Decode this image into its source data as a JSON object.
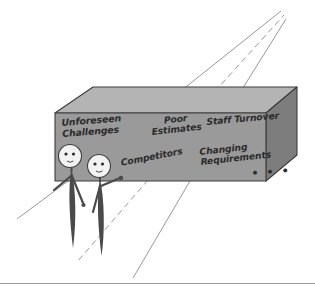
{
  "illustration": {
    "title": "Box of project problems with two stick figures",
    "background_color": "#ffffff",
    "box": {
      "front_face_color": "#9a9a9a",
      "top_face_color": "#b4b4b4",
      "side_face_color": "#7d7d7d",
      "outline_color": "#3d3d3d"
    },
    "labels": [
      {
        "id": "unforeseen-challenges",
        "text": "Unforeseen\nChallenges"
      },
      {
        "id": "poor-estimates",
        "text": "Poor\nEstimates"
      },
      {
        "id": "staff-turnover",
        "text": "Staff Turnover"
      },
      {
        "id": "competitors",
        "text": "Competitors"
      },
      {
        "id": "changing-requirements",
        "text": "Changing\nRequirements"
      },
      {
        "id": "ellipsis",
        "text": "• • •"
      }
    ],
    "figures": [
      {
        "id": "stick-figure-left",
        "body_color": "#4a4a4a",
        "head_color": "#f2f2f2"
      },
      {
        "id": "stick-figure-right",
        "body_color": "#4a4a4a",
        "head_color": "#f2f2f2"
      }
    ],
    "perspective_lines": {
      "color": "#8c8c8c",
      "dashed_color": "#8c8c8c",
      "count": 6
    },
    "divider": {
      "color": "#9b9b9b"
    }
  }
}
